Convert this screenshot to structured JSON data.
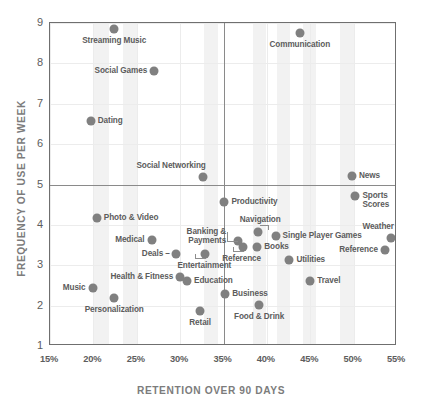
{
  "chart_data": {
    "type": "scatter",
    "title": "",
    "xlabel": "RETENTION OVER 90 DAYS",
    "ylabel": "FREQUENCY OF USE PER WEEK",
    "xlim": [
      15,
      55
    ],
    "ylim": [
      1,
      9
    ],
    "xticks": [
      "15%",
      "20%",
      "25%",
      "30%",
      "35%",
      "40%",
      "45%",
      "50%",
      "55%"
    ],
    "xtick_values": [
      15,
      20,
      25,
      30,
      35,
      40,
      45,
      50,
      55
    ],
    "yticks": [
      "9",
      "8",
      "7",
      "6",
      "5",
      "4",
      "3",
      "2",
      "1"
    ],
    "ytick_values": [
      9,
      8,
      7,
      6,
      5,
      4,
      3,
      2,
      1
    ],
    "grid": true,
    "legend": "none",
    "quadrant_divider_x": 35,
    "quadrant_divider_y": 5,
    "point_color": "#808080",
    "axis_color": "#6f6f6f",
    "label_color": "#5c5c5c",
    "points": [
      {
        "name": "Streaming Music",
        "x": 22.4,
        "y": 8.85,
        "pos": "below-center"
      },
      {
        "name": "Communication",
        "x": 43.8,
        "y": 8.75,
        "pos": "below-center"
      },
      {
        "name": "Social Games",
        "x": 27.0,
        "y": 7.8,
        "pos": "left"
      },
      {
        "name": "Dating",
        "x": 19.7,
        "y": 6.58,
        "pos": "right"
      },
      {
        "name": "Social Networking",
        "x": 32.6,
        "y": 5.18,
        "pos": "above-left"
      },
      {
        "name": "News",
        "x": 49.8,
        "y": 5.2,
        "pos": "right"
      },
      {
        "name": "Sports Scores",
        "x": 50.2,
        "y": 4.72,
        "pos": "right-two"
      },
      {
        "name": "Productivity",
        "x": 35.1,
        "y": 4.58,
        "pos": "right"
      },
      {
        "name": "Photo & Video",
        "x": 20.4,
        "y": 4.17,
        "pos": "right"
      },
      {
        "name": "Navigation",
        "x": 39.0,
        "y": 3.82,
        "pos": "above-leader"
      },
      {
        "name": "Single Player Games",
        "x": 41.0,
        "y": 3.72,
        "pos": "right"
      },
      {
        "name": "Weather",
        "x": 54.3,
        "y": 3.68,
        "pos": "above-left"
      },
      {
        "name": "Medical",
        "x": 26.7,
        "y": 3.62,
        "pos": "left"
      },
      {
        "name": "Banking & Payments",
        "x": 36.7,
        "y": 3.6,
        "pos": "left-two-leader"
      },
      {
        "name": "Books",
        "x": 38.9,
        "y": 3.45,
        "pos": "right"
      },
      {
        "name": "Reference",
        "x": 37.2,
        "y": 3.45,
        "pos": "below-leader"
      },
      {
        "name": "Reference",
        "x": 53.6,
        "y": 3.38,
        "pos": "left"
      },
      {
        "name": "Deals",
        "x": 29.5,
        "y": 3.28,
        "pos": "left-dash"
      },
      {
        "name": "Entertainment",
        "x": 32.9,
        "y": 3.28,
        "pos": "below-leader"
      },
      {
        "name": "Utilities",
        "x": 42.6,
        "y": 3.12,
        "pos": "right"
      },
      {
        "name": "Health & Fitness",
        "x": 30.0,
        "y": 2.72,
        "pos": "left"
      },
      {
        "name": "Travel",
        "x": 45.0,
        "y": 2.62,
        "pos": "right"
      },
      {
        "name": "Education",
        "x": 30.8,
        "y": 2.6,
        "pos": "right"
      },
      {
        "name": "Music",
        "x": 19.9,
        "y": 2.43,
        "pos": "left"
      },
      {
        "name": "Business",
        "x": 35.2,
        "y": 2.3,
        "pos": "right"
      },
      {
        "name": "Personalization",
        "x": 22.4,
        "y": 2.2,
        "pos": "below-center"
      },
      {
        "name": "Food & Drink",
        "x": 39.1,
        "y": 2.02,
        "pos": "below-center"
      },
      {
        "name": "Retail",
        "x": 32.3,
        "y": 1.88,
        "pos": "below-center"
      }
    ]
  }
}
